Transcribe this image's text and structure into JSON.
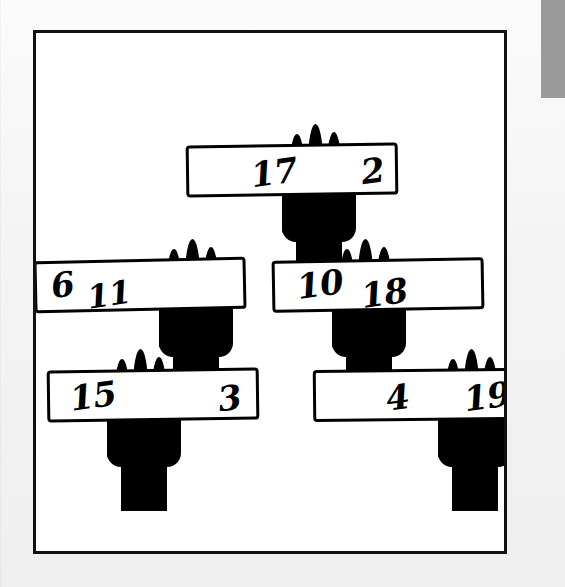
{
  "scene": {
    "title": "Raised hands holding numbered signs",
    "background_color": "#f2f2f2",
    "frame_color": "#111111",
    "ink_color": "#000000",
    "paper_color": "#ffffff",
    "corner_block_color": "#9a9a9a"
  },
  "signs": [
    {
      "id": "sign-top",
      "position": "top-center",
      "left_number": "17",
      "right_number": "2",
      "hand": "center"
    },
    {
      "id": "sign-middle-left",
      "position": "middle-left",
      "left_number": "6",
      "right_number": "11",
      "hand": "right"
    },
    {
      "id": "sign-middle-right",
      "position": "middle-right",
      "left_number": "10",
      "right_number": "18",
      "hand": "center"
    },
    {
      "id": "sign-bottom-left",
      "position": "bottom-left",
      "left_number": "15",
      "right_number": "3",
      "hand": "left"
    },
    {
      "id": "sign-bottom-right",
      "position": "bottom-right",
      "left_number": "4",
      "right_number": "19",
      "hand": "right"
    }
  ]
}
